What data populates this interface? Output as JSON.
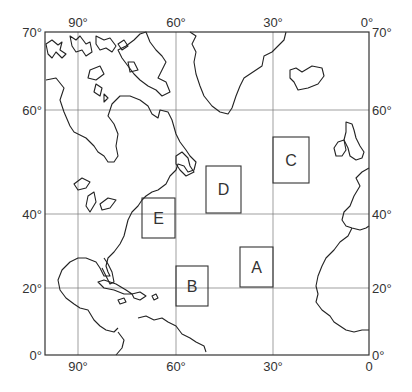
{
  "map": {
    "title": "",
    "frame": {
      "x": 45,
      "y": 32,
      "w": 324,
      "h": 323
    },
    "longitude_labels_top": [
      {
        "text": "90°",
        "x": 78
      },
      {
        "text": "60°",
        "x": 176
      },
      {
        "text": "30°",
        "x": 273
      },
      {
        "text": "0°",
        "x": 367
      }
    ],
    "longitude_labels_bottom": [
      {
        "text": "90°",
        "x": 78
      },
      {
        "text": "60°",
        "x": 176
      },
      {
        "text": "30°",
        "x": 273
      },
      {
        "text": "0",
        "x": 369
      }
    ],
    "latitude_labels_left": [
      {
        "text": "70°",
        "y": 32
      },
      {
        "text": "60°",
        "y": 110
      },
      {
        "text": "40°",
        "y": 214
      },
      {
        "text": "20°",
        "y": 288
      },
      {
        "text": "0°",
        "y": 355
      }
    ],
    "latitude_labels_right": [
      {
        "text": "70°",
        "y": 32
      },
      {
        "text": "60°",
        "y": 110
      },
      {
        "text": "40°",
        "y": 214
      },
      {
        "text": "20°",
        "y": 288
      },
      {
        "text": "0°",
        "y": 355
      }
    ],
    "regions": [
      {
        "label": "A",
        "x": 240,
        "y": 247,
        "w": 33,
        "h": 40
      },
      {
        "label": "B",
        "x": 176,
        "y": 266,
        "w": 32,
        "h": 40
      },
      {
        "label": "C",
        "x": 273,
        "y": 137,
        "w": 36,
        "h": 46
      },
      {
        "label": "D",
        "x": 206,
        "y": 166,
        "w": 35,
        "h": 47
      },
      {
        "label": "E",
        "x": 142,
        "y": 198,
        "w": 33,
        "h": 40
      }
    ]
  }
}
